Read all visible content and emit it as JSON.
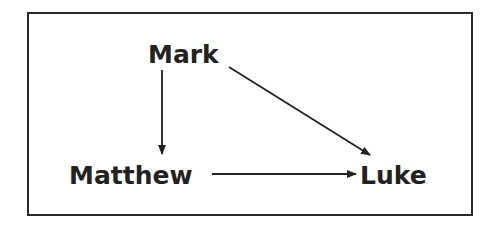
{
  "diagram": {
    "nodes": [
      {
        "id": "mark",
        "label": "Mark"
      },
      {
        "id": "matthew",
        "label": "Matthew"
      },
      {
        "id": "luke",
        "label": "Luke"
      }
    ],
    "edges": [
      {
        "from": "mark",
        "to": "matthew"
      },
      {
        "from": "mark",
        "to": "luke"
      },
      {
        "from": "matthew",
        "to": "luke"
      }
    ]
  }
}
